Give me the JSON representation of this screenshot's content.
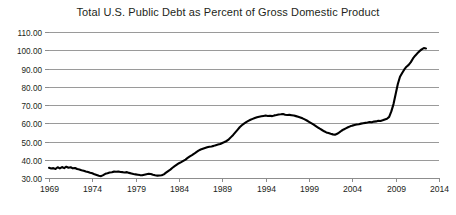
{
  "chart_data": {
    "type": "line",
    "title": "Total U.S. Public Debt as Percent of Gross Domestic Product",
    "xlabel": "",
    "ylabel": "",
    "xlim": [
      1969,
      2014
    ],
    "ylim": [
      30,
      110
    ],
    "grid": true,
    "legend": null,
    "x_ticks": [
      "1969",
      "1974",
      "1979",
      "1984",
      "1989",
      "1994",
      "1999",
      "2004",
      "2009",
      "2014"
    ],
    "x_tick_values": [
      1969,
      1974,
      1979,
      1984,
      1989,
      1994,
      1999,
      2004,
      2009,
      2014
    ],
    "y_ticks": [
      "30.00",
      "40.00",
      "50.00",
      "60.00",
      "70.00",
      "80.00",
      "90.00",
      "100.00",
      "110.00"
    ],
    "y_tick_values": [
      30,
      40,
      50,
      60,
      70,
      80,
      90,
      100,
      110
    ],
    "series": [
      {
        "name": "Total U.S. Public Debt as Percent of GDP",
        "color": "#000000",
        "x": [
          1969.0,
          1969.25,
          1969.5,
          1969.75,
          1970.0,
          1970.25,
          1970.5,
          1970.75,
          1971.0,
          1971.25,
          1971.5,
          1971.75,
          1972.0,
          1972.25,
          1972.5,
          1972.75,
          1973.0,
          1973.25,
          1973.5,
          1973.75,
          1974.0,
          1974.25,
          1974.5,
          1974.75,
          1975.0,
          1975.25,
          1975.5,
          1975.75,
          1976.0,
          1976.25,
          1976.5,
          1976.75,
          1977.0,
          1977.25,
          1977.5,
          1977.75,
          1978.0,
          1978.25,
          1978.5,
          1978.75,
          1979.0,
          1979.25,
          1979.5,
          1979.75,
          1980.0,
          1980.25,
          1980.5,
          1980.75,
          1981.0,
          1981.25,
          1981.5,
          1981.75,
          1982.0,
          1982.25,
          1982.5,
          1982.75,
          1983.0,
          1983.25,
          1983.5,
          1983.75,
          1984.0,
          1984.25,
          1984.5,
          1984.75,
          1985.0,
          1985.25,
          1985.5,
          1985.75,
          1986.0,
          1986.25,
          1986.5,
          1986.75,
          1987.0,
          1987.25,
          1987.5,
          1987.75,
          1988.0,
          1988.25,
          1988.5,
          1988.75,
          1989.0,
          1989.25,
          1989.5,
          1989.75,
          1990.0,
          1990.25,
          1990.5,
          1990.75,
          1991.0,
          1991.25,
          1991.5,
          1991.75,
          1992.0,
          1992.25,
          1992.5,
          1992.75,
          1993.0,
          1993.25,
          1993.5,
          1993.75,
          1994.0,
          1994.25,
          1994.5,
          1994.75,
          1995.0,
          1995.25,
          1995.5,
          1995.75,
          1996.0,
          1996.25,
          1996.5,
          1996.75,
          1997.0,
          1997.25,
          1997.5,
          1997.75,
          1998.0,
          1998.25,
          1998.5,
          1998.75,
          1999.0,
          1999.25,
          1999.5,
          1999.75,
          2000.0,
          2000.25,
          2000.5,
          2000.75,
          2001.0,
          2001.25,
          2001.5,
          2001.75,
          2002.0,
          2002.25,
          2002.5,
          2002.75,
          2003.0,
          2003.25,
          2003.5,
          2003.75,
          2004.0,
          2004.25,
          2004.5,
          2004.75,
          2005.0,
          2005.25,
          2005.5,
          2005.75,
          2006.0,
          2006.25,
          2006.5,
          2006.75,
          2007.0,
          2007.25,
          2007.5,
          2007.75,
          2008.0,
          2008.25,
          2008.5,
          2008.75,
          2009.0,
          2009.25,
          2009.5,
          2009.75,
          2010.0,
          2010.25,
          2010.5,
          2010.75,
          2011.0,
          2011.25,
          2011.5,
          2011.75,
          2012.0,
          2012.25,
          2012.5
        ],
        "y": [
          35.6,
          35.2,
          35.4,
          34.9,
          35.9,
          35.3,
          36.0,
          35.4,
          36.2,
          35.6,
          35.9,
          35.3,
          35.5,
          34.9,
          34.7,
          34.3,
          34.0,
          33.6,
          33.3,
          32.9,
          32.6,
          32.0,
          31.6,
          31.2,
          31.0,
          31.6,
          32.3,
          32.6,
          33.0,
          33.2,
          33.5,
          33.4,
          33.6,
          33.3,
          33.2,
          33.0,
          33.2,
          32.8,
          32.5,
          32.2,
          32.0,
          31.8,
          31.6,
          31.5,
          31.8,
          32.1,
          32.3,
          32.2,
          31.8,
          31.5,
          31.3,
          31.4,
          31.5,
          32.0,
          32.9,
          33.8,
          34.6,
          35.6,
          36.5,
          37.3,
          38.1,
          38.7,
          39.4,
          40.1,
          41.0,
          41.8,
          42.5,
          43.3,
          44.2,
          45.0,
          45.6,
          46.0,
          46.4,
          46.8,
          47.1,
          47.3,
          47.6,
          48.0,
          48.3,
          48.6,
          49.2,
          49.7,
          50.3,
          51.2,
          52.4,
          53.6,
          55.0,
          56.4,
          57.8,
          58.9,
          59.8,
          60.6,
          61.3,
          61.9,
          62.4,
          62.9,
          63.3,
          63.6,
          63.8,
          64.0,
          64.2,
          64.0,
          64.1,
          63.9,
          64.3,
          64.5,
          64.8,
          64.9,
          65.1,
          64.7,
          64.5,
          64.6,
          64.4,
          64.2,
          63.9,
          63.6,
          63.2,
          62.7,
          62.1,
          61.5,
          60.8,
          60.1,
          59.4,
          58.6,
          57.8,
          57.0,
          56.3,
          55.6,
          55.0,
          54.6,
          54.2,
          53.9,
          53.7,
          54.2,
          55.0,
          55.9,
          56.6,
          57.2,
          57.8,
          58.3,
          58.7,
          59.0,
          59.3,
          59.5,
          59.8,
          60.0,
          60.2,
          60.4,
          60.7,
          60.5,
          60.9,
          61.0,
          61.4,
          61.2,
          61.6,
          62.1,
          62.5,
          63.5,
          66.5,
          70.5,
          76.0,
          81.5,
          85.5,
          87.5,
          89.5,
          91.0,
          92.0,
          93.5,
          95.5,
          97.0,
          98.3,
          99.5,
          100.5,
          101.2,
          101.0
        ]
      }
    ]
  }
}
